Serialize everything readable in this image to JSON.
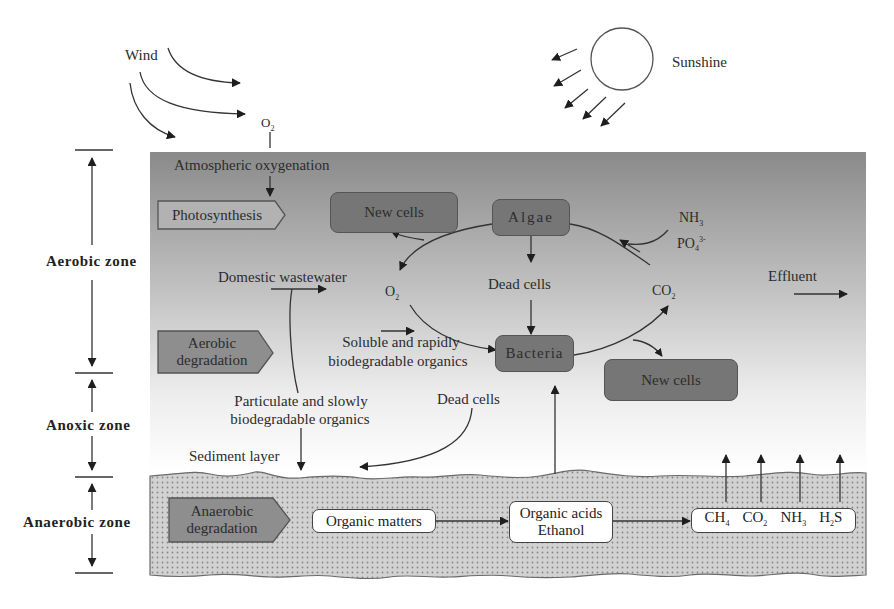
{
  "atmosphere": {
    "wind_label": "Wind",
    "sunshine_label": "Sunshine",
    "o2_label": "O2"
  },
  "zones": {
    "aerobic": "Aerobic zone",
    "anoxic": "Anoxic zone",
    "anaerobic": "Anaerobic zone"
  },
  "aerobic_layer": {
    "atmospheric_oxygenation": "Atmospheric oxygenation",
    "photosynthesis": "Photosynthesis",
    "aerobic_degradation_line1": "Aerobic",
    "aerobic_degradation_line2": "degradation",
    "new_cells_top": "New cells",
    "algae": "Algae",
    "nh3": "NH3",
    "po4": "PO4 3-",
    "domestic_wastewater": "Domestic wastewater",
    "o2": "O2",
    "dead_cells": "Dead cells",
    "co2": "CO2",
    "effluent": "Effluent",
    "soluble_line1": "Soluble and rapidly",
    "soluble_line2": "biodegradable organics",
    "bacteria": "Bacteria",
    "new_cells_bottom": "New cells"
  },
  "anoxic_layer": {
    "particulate_line1": "Particulate and slowly",
    "particulate_line2": "biodegradable organics",
    "dead_cells": "Dead cells",
    "sediment_layer": "Sediment layer"
  },
  "anaerobic_layer": {
    "anaerobic_degradation_line1": "Anaerobic",
    "anaerobic_degradation_line2": "degradation",
    "organic_matters": "Organic matters",
    "organic_acids_line1": "Organic acids",
    "organic_acids_line2": "Ethanol",
    "gases": [
      "CH4",
      "CO2",
      "NH3",
      "H2S"
    ]
  },
  "colors": {
    "water_top": "#8c8c8c",
    "water_bottom": "#ffffff",
    "box_dark": "#767676",
    "sediment": "#cfcfcf",
    "sediment_dots": "#8a8a8a",
    "line": "#333333"
  }
}
